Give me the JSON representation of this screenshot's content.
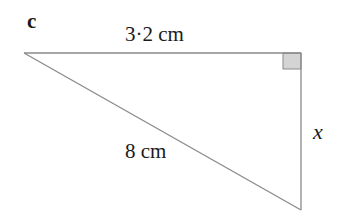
{
  "part_label": "c",
  "triangle": {
    "type": "right-triangle",
    "vertices": {
      "top_left": [
        24,
        53
      ],
      "right_angle": [
        301,
        53
      ],
      "bottom": [
        301,
        210
      ]
    },
    "right_angle_marker": true,
    "stroke_color": "#8a8a8a",
    "marker_fill": "#d4d4d4"
  },
  "sides": {
    "top": "3·2 cm",
    "hypotenuse": "8 cm",
    "vertical": "x"
  }
}
